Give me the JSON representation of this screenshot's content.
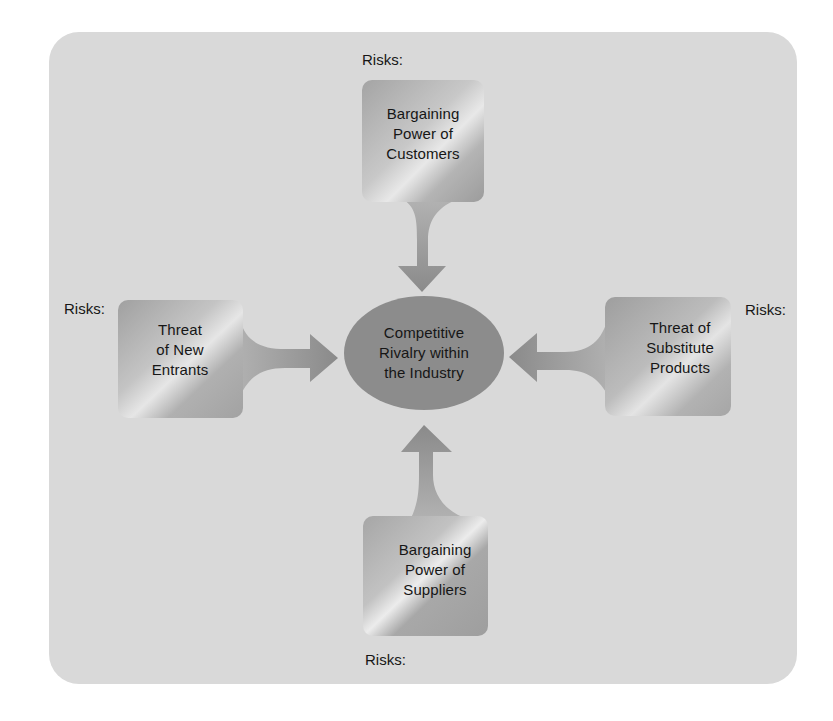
{
  "diagram": {
    "title": "",
    "center": {
      "lines": [
        "Competitive",
        "Rivalry within",
        "the Industry"
      ]
    },
    "forces": {
      "top": {
        "lines": [
          "Bargaining",
          "Power of",
          "Customers"
        ],
        "risks_label": "Risks:"
      },
      "left": {
        "lines": [
          "Threat",
          "of New",
          "Entrants"
        ],
        "risks_label": "Risks:"
      },
      "right": {
        "lines": [
          "Threat of",
          "Substitute",
          "Products"
        ],
        "risks_label": "Risks:"
      },
      "bottom": {
        "lines": [
          "Bargaining",
          "Power of",
          "Suppliers"
        ],
        "risks_label": "Risks:"
      }
    },
    "colors": {
      "panel": "#d9d9d9",
      "box_dark": "#9a9a9a",
      "box_light": "#e6e6e6",
      "arrow": "#8b8b8b",
      "ellipse": "#8c8c8c",
      "text": "#161616"
    }
  }
}
